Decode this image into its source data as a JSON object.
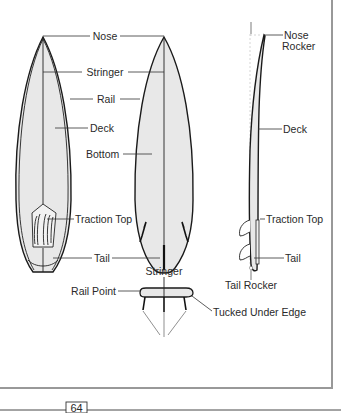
{
  "diagram": {
    "views": [
      "deck-view",
      "bottom-view",
      "side-profile",
      "rail-cross-section"
    ],
    "labels": {
      "nose": "Nose",
      "stringer": "Stringer",
      "rail": "Rail",
      "deck_left": "Deck",
      "bottom": "Bottom",
      "traction_top_left": "Traction Top",
      "tail_left": "Tail",
      "nose_rocker_line1": "Nose",
      "nose_rocker_line2": "Rocker",
      "deck_right": "Deck",
      "traction_top_right": "Traction Top",
      "tail_right": "Tail",
      "tail_rocker": "Tail Rocker",
      "stringer_section": "Stringer",
      "rail_point": "Rail Point",
      "tucked_under_edge": "Tucked Under Edge"
    },
    "colors": {
      "board_fill": "#e8e8e8",
      "outline": "#1a1a1a",
      "text": "#2a2a2a"
    }
  },
  "footer": {
    "page_number": "64"
  }
}
